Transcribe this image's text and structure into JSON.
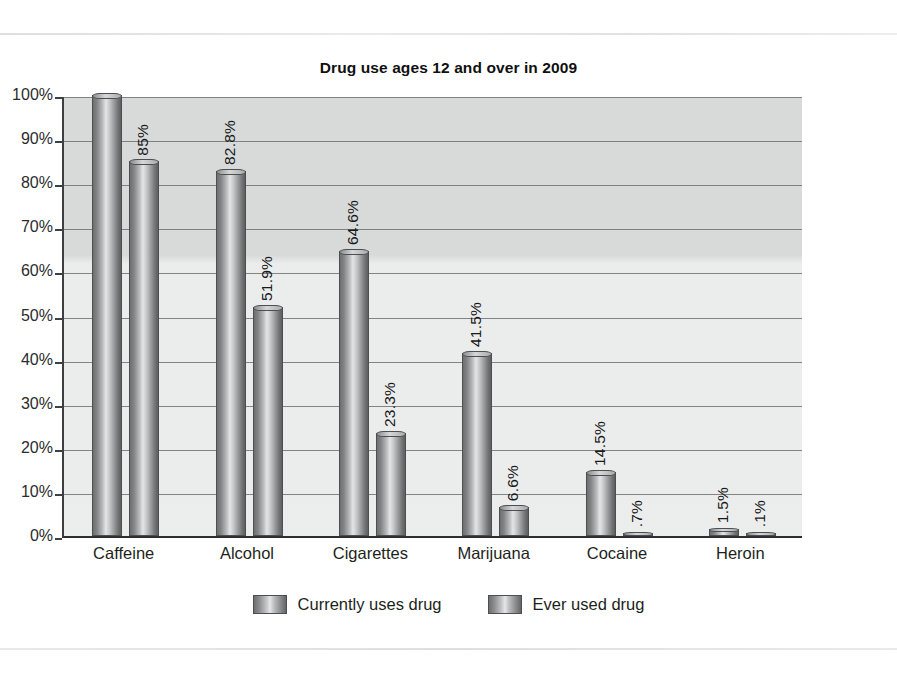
{
  "chart_data": {
    "type": "bar",
    "title": "Drug use ages 12 and over in 2009",
    "xlabel": "",
    "ylabel": "",
    "ylim": [
      0,
      100
    ],
    "grid": true,
    "legend_position": "bottom",
    "categories": [
      "Caffeine",
      "Alcohol",
      "Cigarettes",
      "Marijuana",
      "Cocaine",
      "Heroin"
    ],
    "tick_labels": [
      "0%",
      "10%",
      "20%",
      "30%",
      "40%",
      "50%",
      "60%",
      "70%",
      "80%",
      "90%",
      "100%"
    ],
    "series": [
      {
        "name": "Currently uses drug",
        "values": [
          100,
          82.8,
          64.6,
          41.5,
          14.5,
          1.5
        ],
        "labels": [
          "",
          "82.8%",
          "64.6%",
          "41.5%",
          "14.5%",
          "1.5%"
        ]
      },
      {
        "name": "Ever used drug",
        "values": [
          85,
          51.9,
          23.3,
          6.6,
          0.7,
          0.1
        ],
        "labels": [
          "85%",
          "51.9%",
          "23.3%",
          "6.6%",
          ".7%",
          ".1%"
        ]
      }
    ],
    "colors": {
      "bar_light": "#e4e5e6",
      "bar_dark": "#5d5f61",
      "plot_background": "#e9eaea",
      "axis": "#2e3031",
      "gridline": "#6f7173",
      "text": "#17191a"
    }
  }
}
